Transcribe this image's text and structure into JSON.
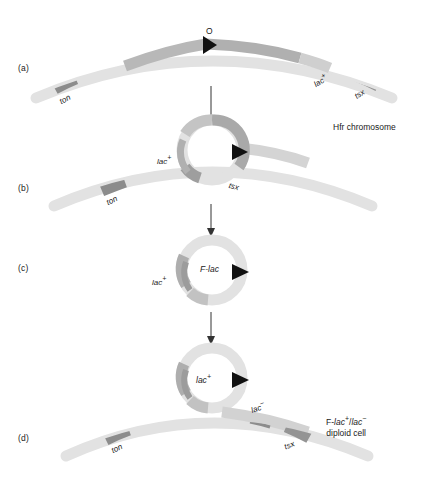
{
  "figure": {
    "background_color": "#ffffff"
  },
  "colors": {
    "chromosome_light": "#e2e2e2",
    "chromosome_mid": "#c9c9c9",
    "chromosome_dark": "#9a9a9a",
    "marker_dark": "#8c8c8c",
    "arrow_black": "#111111",
    "text": "#1a1a1a"
  },
  "panels": [
    {
      "id": "a",
      "label": "(a)"
    },
    {
      "id": "b",
      "label": "(b)"
    },
    {
      "id": "c",
      "label": "(c)"
    },
    {
      "id": "d",
      "label": "(d)"
    }
  ],
  "panel_a": {
    "origin_label": "O",
    "gene_ton": "ton",
    "gene_lac": "lac",
    "gene_lac_sup": "+",
    "gene_tsx": "tsx",
    "caption": "Hfr chromosome"
  },
  "panel_b": {
    "gene_ton": "ton",
    "gene_lac": "lac",
    "gene_lac_sup": "+",
    "gene_tsx": "tsx"
  },
  "panel_c": {
    "ring_label": "F-lac",
    "gene_lac": "lac",
    "gene_lac_sup": "+"
  },
  "panel_d": {
    "ring_label": "lac",
    "ring_label_sup": "+",
    "gene_ton": "ton",
    "gene_lac": "lac",
    "gene_lac_sup": "−",
    "gene_tsx": "tsx",
    "caption_line1_prefix": "F-",
    "caption_line1_gene1": "lac",
    "caption_line1_sup1": "+",
    "caption_line1_sep": "/",
    "caption_line1_gene2": "lac",
    "caption_line1_sup2": "−",
    "caption_line2": "diploid cell"
  },
  "arrows": [
    {
      "name": "arrow-a-to-b",
      "from_panel": "a",
      "to_panel": "b"
    },
    {
      "name": "arrow-b-to-c",
      "from_panel": "b",
      "to_panel": "c"
    },
    {
      "name": "arrow-c-to-d",
      "from_panel": "c",
      "to_panel": "d"
    }
  ]
}
